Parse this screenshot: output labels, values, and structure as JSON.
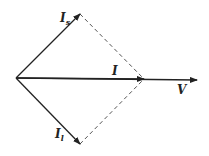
{
  "diagram": {
    "colors": {
      "stroke": "#222222",
      "dashed": "#555555",
      "background": "#ffffff"
    },
    "origin": [
      16,
      78
    ],
    "vectors": [
      {
        "id": "Is",
        "label": "I",
        "subscript": "s",
        "tip": [
          80,
          14
        ]
      },
      {
        "id": "I",
        "label": "I",
        "subscript": "",
        "tip": [
          144,
          79
        ]
      },
      {
        "id": "V",
        "label": "V",
        "subscript": "",
        "tip": [
          197,
          80
        ]
      },
      {
        "id": "Il",
        "label": "I",
        "subscript": "l",
        "tip": [
          80,
          144
        ]
      }
    ],
    "labels": {
      "Is": "I",
      "Is_sub": "s",
      "I": "I",
      "V": "V",
      "Il": "I",
      "Il_sub": "l"
    }
  }
}
